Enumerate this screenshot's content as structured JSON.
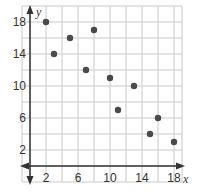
{
  "chart_data": {
    "type": "scatter",
    "title": "",
    "xlabel": "x",
    "ylabel": "y",
    "xlim": [
      -1,
      20
    ],
    "ylim": [
      -1,
      20
    ],
    "grid": true,
    "grid_step": 2,
    "x_ticks": [
      2,
      6,
      10,
      14,
      18
    ],
    "y_ticks": [
      2,
      6,
      10,
      14,
      18
    ],
    "points": [
      {
        "x": 2,
        "y": 18
      },
      {
        "x": 3,
        "y": 14
      },
      {
        "x": 5,
        "y": 16
      },
      {
        "x": 7,
        "y": 12
      },
      {
        "x": 8,
        "y": 17
      },
      {
        "x": 10,
        "y": 11
      },
      {
        "x": 11,
        "y": 7
      },
      {
        "x": 13,
        "y": 10
      },
      {
        "x": 15,
        "y": 4
      },
      {
        "x": 16,
        "y": 6
      },
      {
        "x": 18,
        "y": 3
      }
    ],
    "colors": {
      "point": "#4a4a4a",
      "grid": "#c8c8c8",
      "axis": "#333333"
    }
  }
}
